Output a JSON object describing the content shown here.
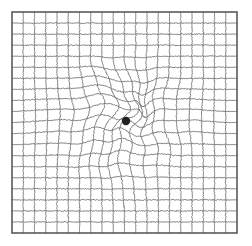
{
  "chart_type": "amsler-grid",
  "canvas": {
    "width": 252,
    "height": 246,
    "background": "#ffffff"
  },
  "grid": {
    "x0": 12,
    "y0": 12,
    "x1": 237,
    "y1": 233,
    "cols": 20,
    "rows": 20,
    "line_color": "#6e6e6e",
    "line_width": 0.9,
    "border_color": "#555555",
    "border_width": 1.3,
    "samples_per_segment": 14
  },
  "fixation_dot": {
    "label": "central fixation dot",
    "cx": 126,
    "cy": 121,
    "r": 4.2,
    "color": "#231f20"
  },
  "distortion": {
    "description": "central wavy warp simulating metamorphopsia",
    "center": {
      "x": 124,
      "y": 119
    },
    "radius": 86,
    "swirl_strength": 7.4,
    "pull_strength": 10.5,
    "ripple_amplitude": 3.1,
    "ripple_frequency": 0.085,
    "seed": 20,
    "lobes": [
      {
        "x": 118,
        "y": 112,
        "radius": 58,
        "amp": 8.5,
        "angle": 0.0
      },
      {
        "x": 150,
        "y": 104,
        "radius": 46,
        "amp": -6.0,
        "angle": 1.1
      },
      {
        "x": 104,
        "y": 148,
        "radius": 48,
        "amp": 5.2,
        "angle": 2.3
      },
      {
        "x": 160,
        "y": 140,
        "radius": 40,
        "amp": -4.4,
        "angle": 3.5
      },
      {
        "x": 96,
        "y": 92,
        "radius": 42,
        "amp": 4.8,
        "angle": 4.6
      },
      {
        "x": 60,
        "y": 120,
        "radius": 52,
        "amp": 3.4,
        "angle": 5.4
      },
      {
        "x": 186,
        "y": 120,
        "radius": 44,
        "amp": -3.6,
        "angle": 0.8
      },
      {
        "x": 130,
        "y": 176,
        "radius": 40,
        "amp": 3.0,
        "angle": 2.9
      }
    ]
  }
}
